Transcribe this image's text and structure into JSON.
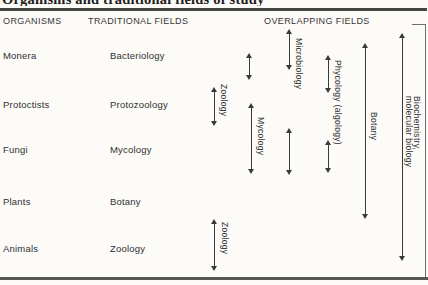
{
  "title": "Organisms and traditional fields of study",
  "headers": {
    "organisms": "ORGANISMS",
    "traditional": "TRADITIONAL FIELDS",
    "overlapping": "OVERLAPPING FIELDS"
  },
  "rows": [
    {
      "organism": "Monera",
      "field": "Bacteriology"
    },
    {
      "organism": "Protoctists",
      "field": "Protozoology"
    },
    {
      "organism": "Fungi",
      "field": "Mycology"
    },
    {
      "organism": "Plants",
      "field": "Botany"
    },
    {
      "organism": "Animals",
      "field": "Zoology"
    }
  ],
  "overlapping_fields": {
    "zoology_upper": "Zoology",
    "mycology": "Mycology",
    "microbiology": "Microbiology",
    "phycology": "Phycology (algology)",
    "botany": "Botany",
    "biochemistry_line1": "Biochemistry,",
    "biochemistry_line2": "molecular biology",
    "zoology_lower": "Zoology"
  },
  "colors": {
    "background": "#fcfbf8",
    "text": "#2f2f2f",
    "rule": "#454545",
    "arrow": "#3a3a3a"
  }
}
